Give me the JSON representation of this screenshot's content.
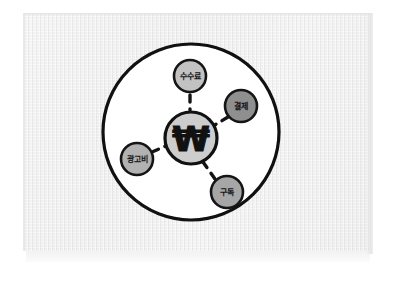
{
  "canvas": {
    "width": 396,
    "height": 283,
    "background_color": "#ffffff"
  },
  "paper": {
    "name": "paper-sheet",
    "fill_color": "#f0f0f0",
    "x": 23,
    "y": 13,
    "width": 350,
    "height": 238
  },
  "diagram": {
    "title": "",
    "style": "hand-drawn sketch mind map",
    "outer_circle": {
      "name": "outer-boundary-circle",
      "cx": 191,
      "cy": 132,
      "r": 88,
      "fill_color": "#ffffff",
      "stroke_color": "#111111",
      "stroke_width": 3.2
    },
    "center_node": {
      "name": "center-node-won",
      "label": "₩",
      "icon": "korean-won-symbol",
      "cx": 191,
      "cy": 138,
      "r": 26,
      "fill_color": "#cdcdcd",
      "stroke_color": "#111111",
      "stroke_width": 3.2
    },
    "nodes": [
      {
        "id": "fee",
        "name": "node-fee",
        "label": "수수료",
        "cx": 190,
        "cy": 76,
        "r": 16,
        "fill_color": "#c2c2c2",
        "stroke_color": "#151515",
        "stroke_width": 2.6,
        "font_size": 8
      },
      {
        "id": "payment",
        "name": "node-payment",
        "label": "결제",
        "cx": 241,
        "cy": 106,
        "r": 16,
        "fill_color": "#8f8f8f",
        "stroke_color": "#151515",
        "stroke_width": 2.6,
        "font_size": 8
      },
      {
        "id": "ad-cost",
        "name": "node-ad-cost",
        "label": "광고비",
        "cx": 137,
        "cy": 159,
        "r": 16,
        "fill_color": "#b2b2b2",
        "stroke_color": "#151515",
        "stroke_width": 2.6,
        "font_size": 8
      },
      {
        "id": "subscription",
        "name": "node-subscription",
        "label": "구독",
        "cx": 227,
        "cy": 192,
        "r": 16,
        "fill_color": "#a6a6a6",
        "stroke_color": "#151515",
        "stroke_width": 2.6,
        "font_size": 8
      }
    ],
    "connectors": [
      {
        "name": "connector-center-to-fee",
        "from": "center",
        "to": "fee",
        "x1": 190,
        "y1": 95,
        "x2": 190,
        "y2": 110,
        "stroke_color": "#141414",
        "stroke_width": 3.4,
        "dash": "7 7"
      },
      {
        "name": "connector-center-to-payment",
        "from": "center",
        "to": "payment",
        "x1": 228,
        "y1": 117,
        "x2": 213,
        "y2": 126,
        "stroke_color": "#141414",
        "stroke_width": 3.4,
        "dash": "7 7"
      },
      {
        "name": "connector-center-to-ad-cost",
        "from": "center",
        "to": "ad-cost",
        "x1": 152,
        "y1": 152,
        "x2": 168,
        "y2": 145,
        "stroke_color": "#141414",
        "stroke_width": 3.4,
        "dash": "7 7"
      },
      {
        "name": "connector-center-to-subscription",
        "from": "center",
        "to": "subscription",
        "x1": 215,
        "y1": 179,
        "x2": 203,
        "y2": 162,
        "stroke_color": "#141414",
        "stroke_width": 3.4,
        "dash": "7 7"
      }
    ]
  }
}
